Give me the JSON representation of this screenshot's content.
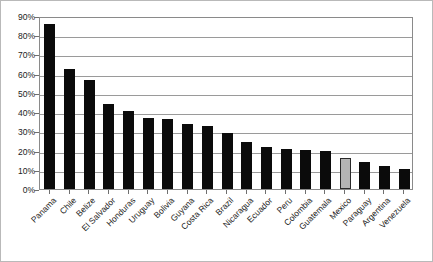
{
  "chart_data": {
    "type": "bar",
    "title": "",
    "subtitle": "",
    "xlabel": "",
    "ylabel": "",
    "ylim": [
      0,
      90
    ],
    "ytick_step": 10,
    "grid": true,
    "legend": "none",
    "yticks": [
      "0%",
      "10%",
      "20%",
      "30%",
      "40%",
      "50%",
      "60%",
      "70%",
      "80%",
      "90%"
    ],
    "categories": [
      "Panama",
      "Chile",
      "Belize",
      "El Salvador",
      "Honduras",
      "Uruguay",
      "Bolivia",
      "Guyana",
      "Costa Rica",
      "Brazil",
      "Nicaragua",
      "Ecuador",
      "Peru",
      "Colombia",
      "Guatemala",
      "Mexico",
      "Paraguay",
      "Argentina",
      "Venezuela"
    ],
    "values": [
      86,
      62.5,
      56.5,
      44,
      40.5,
      37,
      36.5,
      34,
      33,
      29,
      24.5,
      22,
      21,
      20.5,
      20,
      16,
      14,
      12,
      10.5
    ],
    "highlight_index": 15,
    "colors": {
      "bar": "#0b0b0b",
      "bar_highlight": "#b5b5b5",
      "bar_highlight_border": "#2a2a2a",
      "grid": "#9a9a9a",
      "axis": "#8a8a8a",
      "background": "#ffffff",
      "text": "#1c1c1c"
    }
  }
}
